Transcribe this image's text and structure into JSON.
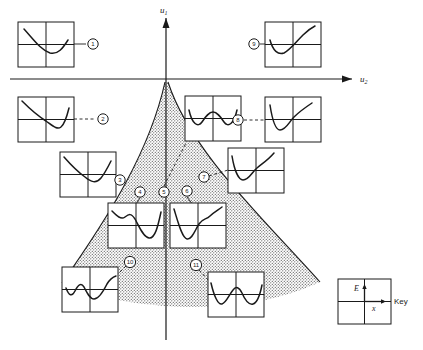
{
  "figure": {
    "title": "",
    "axes": {
      "vertical_label": "u",
      "vertical_sub": "1",
      "horizontal_label": "u",
      "horizontal_sub": "2"
    },
    "key": {
      "label": "Key",
      "energy_axis": "E",
      "position_axis": "x"
    },
    "region": {
      "fill": "#d9d9d9",
      "name": "stippled-region"
    },
    "markers": [
      {
        "id": "1",
        "label": "1",
        "cx": 93,
        "cy": 44,
        "connector": "solid"
      },
      {
        "id": "2",
        "label": "2",
        "cx": 103,
        "cy": 119,
        "connector": "dashed"
      },
      {
        "id": "3",
        "label": "3",
        "cx": 118,
        "cy": 180,
        "connector": "dashed"
      },
      {
        "id": "4",
        "label": "4",
        "cx": 140,
        "cy": 192,
        "connector": "solid"
      },
      {
        "id": "5",
        "label": "5",
        "cx": 164,
        "cy": 192,
        "connector": "solid"
      },
      {
        "id": "6",
        "label": "6",
        "cx": 187,
        "cy": 191,
        "connector": "solid"
      },
      {
        "id": "7",
        "label": "7",
        "cx": 203,
        "cy": 177,
        "connector": "dashed"
      },
      {
        "id": "8",
        "label": "8",
        "cx": 238,
        "cy": 120,
        "connector": "dashed"
      },
      {
        "id": "9",
        "label": "9",
        "cx": 254,
        "cy": 44,
        "connector": "solid"
      },
      {
        "id": "10",
        "label": "10",
        "cx": 130,
        "cy": 262,
        "connector": "dashed"
      },
      {
        "id": "11",
        "label": "11",
        "cx": 196,
        "cy": 265,
        "connector": "dashed"
      }
    ],
    "insets": [
      {
        "name": "inset-1",
        "x": 18,
        "y": 22,
        "w": 56,
        "h": 45,
        "curve": "down-dip-up",
        "for_marker": "1"
      },
      {
        "name": "inset-2",
        "x": 18,
        "y": 97,
        "w": 56,
        "h": 45,
        "curve": "steep-dip-up",
        "for_marker": "2"
      },
      {
        "name": "inset-3",
        "x": 60,
        "y": 152,
        "w": 56,
        "h": 45,
        "curve": "down-dip-flat",
        "for_marker": "3"
      },
      {
        "name": "inset-4",
        "x": 108,
        "y": 203,
        "w": 56,
        "h": 45,
        "curve": "wiggle-dip",
        "for_marker": "4"
      },
      {
        "name": "inset-5",
        "x": 185,
        "y": 96,
        "w": 56,
        "h": 45,
        "curve": "double-well",
        "for_marker": "5"
      },
      {
        "name": "inset-6",
        "x": 170,
        "y": 203,
        "w": 56,
        "h": 45,
        "curve": "dip-wiggle-up",
        "for_marker": "6"
      },
      {
        "name": "inset-7",
        "x": 228,
        "y": 148,
        "w": 56,
        "h": 45,
        "curve": "dip-rise",
        "for_marker": "7"
      },
      {
        "name": "inset-8",
        "x": 265,
        "y": 97,
        "w": 56,
        "h": 45,
        "curve": "dip-rise",
        "for_marker": "8"
      },
      {
        "name": "inset-9",
        "x": 265,
        "y": 22,
        "w": 56,
        "h": 45,
        "curve": "dip-rise-steep",
        "for_marker": "9"
      },
      {
        "name": "inset-10",
        "x": 62,
        "y": 267,
        "w": 56,
        "h": 45,
        "curve": "wave-two-min",
        "for_marker": "10"
      },
      {
        "name": "inset-11",
        "x": 208,
        "y": 272,
        "w": 56,
        "h": 45,
        "curve": "wave-two-min-b",
        "for_marker": "11"
      }
    ]
  }
}
